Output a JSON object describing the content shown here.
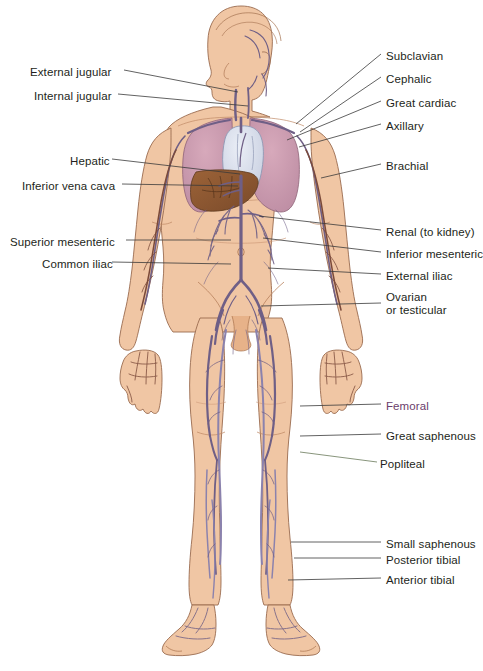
{
  "figure": {
    "background_color": "#ffffff",
    "label_color": "#231f20",
    "accent_label_color": "#6b3d6b"
  },
  "labels_left": [
    {
      "id": "external-jugular",
      "text": "External jugular",
      "x": 30,
      "y": 66,
      "line_to_x": 238,
      "line_to_y": 90
    },
    {
      "id": "internal-jugular",
      "text": "Internal jugular",
      "x": 34,
      "y": 90,
      "line_to_x": 245,
      "line_to_y": 105
    },
    {
      "id": "hepatic",
      "text": "Hepatic",
      "x": 70,
      "y": 155,
      "line_to_x": 242,
      "line_to_y": 172
    },
    {
      "id": "inferior-vena-cava",
      "text": "Inferior vena cava",
      "x": 22,
      "y": 180,
      "line_to_x": 240,
      "line_to_y": 186
    },
    {
      "id": "superior-mesenteric",
      "text": "Superior mesenteric",
      "x": 10,
      "y": 236,
      "line_to_x": 232,
      "line_to_y": 238
    },
    {
      "id": "common-iliac",
      "text": "Common iliac",
      "x": 42,
      "y": 258,
      "line_to_x": 232,
      "line_to_y": 262
    }
  ],
  "labels_right": [
    {
      "id": "subclavian",
      "text": "Subclavian",
      "x": 386,
      "y": 50,
      "line_from_x": 296,
      "line_from_y": 124
    },
    {
      "id": "cephalic",
      "text": "Cephalic",
      "x": 386,
      "y": 73,
      "line_from_x": 302,
      "line_from_y": 133
    },
    {
      "id": "great-cardiac",
      "text": "Great cardiac",
      "x": 386,
      "y": 97,
      "line_from_x": 288,
      "line_from_y": 140
    },
    {
      "id": "axillary",
      "text": "Axillary",
      "x": 386,
      "y": 120,
      "line_from_x": 300,
      "line_from_y": 146
    },
    {
      "id": "brachial",
      "text": "Brachial",
      "x": 386,
      "y": 160,
      "line_from_x": 320,
      "line_from_y": 176
    },
    {
      "id": "renal",
      "text": "Renal (to kidney)",
      "x": 386,
      "y": 226,
      "line_from_x": 258,
      "line_from_y": 214
    },
    {
      "id": "inferior-mesenteric",
      "text": "Inferior mesenteric",
      "x": 386,
      "y": 248,
      "line_from_x": 262,
      "line_from_y": 236
    },
    {
      "id": "external-iliac",
      "text": "External iliac",
      "x": 386,
      "y": 270,
      "line_from_x": 268,
      "line_from_y": 268
    },
    {
      "id": "ovarian-testicular",
      "text": "Ovarian",
      "text2": "or testicular",
      "x": 386,
      "y": 291,
      "line_from_x": 262,
      "line_from_y": 305
    },
    {
      "id": "femoral",
      "text": "Femoral",
      "x": 386,
      "y": 400,
      "line_from_x": 300,
      "line_from_y": 404,
      "color": "#6b3d6b"
    },
    {
      "id": "great-saphenous",
      "text": "Great saphenous",
      "x": 386,
      "y": 430,
      "line_from_x": 300,
      "line_from_y": 434
    },
    {
      "id": "popliteal",
      "text": "Popliteal",
      "x": 380,
      "y": 458,
      "line_from_x": 300,
      "line_from_y": 452
    },
    {
      "id": "small-saphenous",
      "text": "Small saphenous",
      "x": 386,
      "y": 538,
      "line_from_x": 292,
      "line_from_y": 540
    },
    {
      "id": "posterior-tibial",
      "text": "Posterior tibial",
      "x": 386,
      "y": 554,
      "line_from_x": 295,
      "line_from_y": 556
    },
    {
      "id": "anterior-tibial",
      "text": "Anterior tibial",
      "x": 386,
      "y": 574,
      "line_from_x": 288,
      "line_from_y": 578
    }
  ],
  "anatomy": {
    "skin_color": "#f0c6a4",
    "skin_outline": "#9a6b4f",
    "lung_color": "#c99aae",
    "heart_color": "#d8dcea",
    "liver_color": "#8b5a34",
    "vein_color": "#8b82ad",
    "vein_dark": "#6f5f86",
    "organs": [
      "lungs",
      "heart",
      "liver"
    ]
  }
}
